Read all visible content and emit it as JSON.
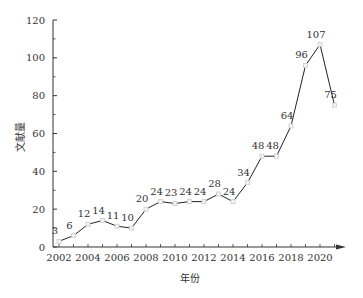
{
  "chart_data": {
    "type": "line",
    "title": "",
    "xlabel": "年份",
    "ylabel": "文献量",
    "x": [
      2002,
      2003,
      2004,
      2005,
      2006,
      2007,
      2008,
      2009,
      2010,
      2011,
      2012,
      2013,
      2014,
      2015,
      2016,
      2017,
      2018,
      2019,
      2020,
      2021
    ],
    "values": [
      3,
      6,
      12,
      14,
      11,
      10,
      20,
      24,
      23,
      24,
      24,
      28,
      24,
      34,
      48,
      48,
      64,
      96,
      107,
      75
    ],
    "ylim": [
      0,
      120
    ],
    "yticks": [
      0,
      20,
      40,
      60,
      80,
      100,
      120
    ],
    "xticks": [
      2002,
      2004,
      2006,
      2008,
      2010,
      2012,
      2014,
      2016,
      2018,
      2020
    ],
    "grid": false,
    "legend": "none",
    "colors": {
      "line": "#222222",
      "marker": "#cccccc",
      "axis": "#333333"
    }
  }
}
